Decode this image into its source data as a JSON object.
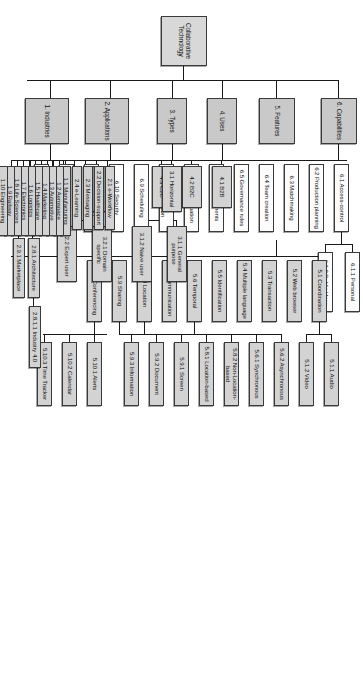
{
  "diagram": {
    "title": "Collaborative Technology",
    "type": "hierarchical-taxonomy-tree",
    "orientation": "rotated-90-clockwise",
    "colors": {
      "node_fill_shaded": "#d3d3d3",
      "node_fill_white": "#fcfcfc",
      "node_border": "#3a3a3a",
      "connector": "#1a1a1a",
      "background": "#ffffff"
    },
    "root": {
      "label": "Collaborative Technology"
    },
    "branches": [
      {
        "id": "1",
        "label": "1. Industries",
        "children": [
          {
            "id": "1.1",
            "label": "1.1 Manufacturing"
          },
          {
            "id": "1.2",
            "label": "1.2 Aerospace"
          },
          {
            "id": "1.3",
            "label": "1.3 Automotive"
          },
          {
            "id": "1.4",
            "label": "1.4 Marketing"
          },
          {
            "id": "1.5",
            "label": "1.5 Healthcare"
          },
          {
            "id": "1.6",
            "label": "1.6 Logistics"
          },
          {
            "id": "1.7",
            "label": "1.7 Electronics"
          },
          {
            "id": "1.8",
            "label": "1.8 Life Sciences"
          },
          {
            "id": "1.9",
            "label": "1.9 Railway"
          },
          {
            "id": "1.10",
            "label": "1.10 Engineering"
          }
        ]
      },
      {
        "id": "2",
        "label": "2. Applications",
        "children": [
          {
            "id": "2.1",
            "label": "2.1 e-Workflow"
          },
          {
            "id": "2.2",
            "label": "2.2 Decision-support"
          },
          {
            "id": "2.3",
            "label": "2.3 Messaging"
          },
          {
            "id": "2.4",
            "label": "2.4 e-Learning"
          },
          {
            "id": "2.5",
            "label": "2.5 News Bulletin"
          },
          {
            "id": "2.6",
            "label": "2.6 Problem solving"
          },
          {
            "id": "2.7",
            "label": "2.7 Portal"
          },
          {
            "id": "2.8",
            "label": "2.8 System",
            "children": [
              {
                "id": "2.8.1",
                "label": "2.8.1 Architecture",
                "children": [
                  {
                    "id": "2.8.1.1",
                    "label": "2.8.1.1 Industry 4.0"
                  }
                ]
              }
            ]
          },
          {
            "id": "2.9",
            "label": "2.9 e-Commerce",
            "children": [
              {
                "id": "2.9.1",
                "label": "2.9.1 Marketplace"
              }
            ]
          }
        ]
      },
      {
        "id": "3",
        "label": "3. Types",
        "children": [
          {
            "id": "3.1",
            "label": "3.1 Horizontal",
            "children": [
              {
                "id": "3.1.1",
                "label": "3.1.1 General purpose"
              },
              {
                "id": "3.1.2",
                "label": "3.1.2 Naive user"
              }
            ]
          },
          {
            "id": "3.2",
            "label": "3.2 Vertical",
            "children": [
              {
                "id": "3.2.1",
                "label": "3.2.1 Domain specific"
              },
              {
                "id": "3.2.2",
                "label": "3.2.2 Expert user"
              }
            ]
          }
        ]
      },
      {
        "id": "4",
        "label": "4. Uses",
        "children": [
          {
            "id": "4.1",
            "label": "4.1 B2B"
          },
          {
            "id": "4.2",
            "label": "4.2 B2C"
          },
          {
            "id": "4.3",
            "label": "4.3 C2C"
          }
        ]
      },
      {
        "id": "5",
        "label": "5. Features",
        "children": [
          {
            "id": "5.1",
            "label": "5.1 Coordination",
            "children": [
              {
                "id": "5.1.1",
                "label": "5.1.1 Audio"
              },
              {
                "id": "5.1.2",
                "label": "5.1.2 Video"
              }
            ]
          },
          {
            "id": "5.2",
            "label": "5.2 Web browser"
          },
          {
            "id": "5.3",
            "label": "5.3 Transaction"
          },
          {
            "id": "5.4",
            "label": "5.4 Multiple language"
          },
          {
            "id": "5.5",
            "label": "5.5 Identification"
          },
          {
            "id": "5.6",
            "label": "5.6 Temporal",
            "children": [
              {
                "id": "5.6.1",
                "label": "5.6.1 Synchronous"
              },
              {
                "id": "5.6.2",
                "label": "5.6.2 Asynchronous"
              }
            ]
          },
          {
            "id": "5.7",
            "label": "5.7 Communication"
          },
          {
            "id": "5.8",
            "label": "5.8 Location",
            "children": [
              {
                "id": "5.8.1",
                "label": "5.8.1 Location-based"
              },
              {
                "id": "5.8.2",
                "label": "5.8.2 Non-Location-based"
              }
            ]
          },
          {
            "id": "5.9",
            "label": "5.9 Sharing",
            "children": [
              {
                "id": "5.9.1",
                "label": "5.9.1 Screen"
              },
              {
                "id": "5.9.2",
                "label": "5.9.2 Document"
              },
              {
                "id": "5.9.3",
                "label": "5.9.3 Information"
              }
            ]
          },
          {
            "id": "5.10",
            "label": "5.10 Conferencing",
            "children": [
              {
                "id": "5.10.1",
                "label": "5.10.1 Alerts"
              },
              {
                "id": "5.10.2",
                "label": "5.10.2 Calendar"
              },
              {
                "id": "5.10.3",
                "label": "5.10.3 Time Tracker"
              }
            ]
          }
        ]
      },
      {
        "id": "6",
        "label": "6. Capabilities",
        "children": [
          {
            "id": "6.1",
            "label": "6.1 Access-control",
            "children": [
              {
                "id": "6.1.1",
                "label": "6.1.1 Personal"
              },
              {
                "id": "6.1.2",
                "label": "6.1.2 Public User"
              }
            ]
          },
          {
            "id": "6.2",
            "label": "6.2 Production planning"
          },
          {
            "id": "6.3",
            "label": "6.3 Matchmaking"
          },
          {
            "id": "6.4",
            "label": "6.4 Team creation"
          },
          {
            "id": "6.5",
            "label": "6.5 Governance rules"
          },
          {
            "id": "6.6",
            "label": "6.6 Requirements"
          },
          {
            "id": "6.7",
            "label": "6.7 Risk evaluation"
          },
          {
            "id": "6.8",
            "label": "6.8 Tender decomposition"
          },
          {
            "id": "6.9",
            "label": "6.9 Scheduling"
          },
          {
            "id": "6.10",
            "label": "6.10 Security"
          },
          {
            "id": "6.11",
            "label": "6.11 Standard"
          },
          {
            "id": "6.12",
            "label": "6.12 Adaptation"
          },
          {
            "id": "6.13",
            "label": "6.13 Prediction"
          }
        ]
      }
    ]
  }
}
